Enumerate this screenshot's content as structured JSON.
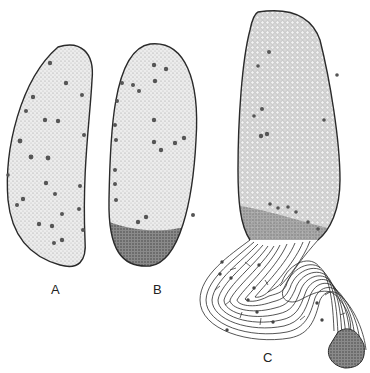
{
  "figure": {
    "panels": [
      {
        "id": "A",
        "label": "A",
        "description": "elongated kidney-shaped cell mass with scattered dark nuclei"
      },
      {
        "id": "B",
        "label": "B",
        "description": "oval cell mass with dense darkly-stippled basal region"
      },
      {
        "id": "C",
        "label": "C",
        "description": "elongated cell mass transitioning into a coiled, striated tube ending in a dense stippled tip"
      }
    ],
    "colors": {
      "background": "#ffffff",
      "outline": "#2a2a2a",
      "fill": "#e6e6e6",
      "nucleus": "#555555",
      "dense": "#6a6a6a"
    }
  }
}
